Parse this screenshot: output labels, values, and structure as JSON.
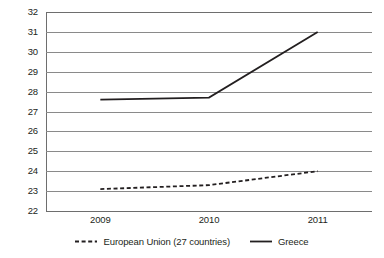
{
  "chart_data": {
    "type": "line",
    "title": "",
    "subtitle": "",
    "xlabel": "",
    "ylabel": "",
    "categories": [
      "2009",
      "2010",
      "2011"
    ],
    "ylim": [
      22,
      32
    ],
    "y_ticks": [
      22,
      23,
      24,
      25,
      26,
      27,
      28,
      29,
      30,
      31,
      32
    ],
    "y_tick_labels": [
      "22",
      "23",
      "24",
      "25",
      "26",
      "27",
      "28",
      "29",
      "30",
      "31",
      "32"
    ],
    "grid": true,
    "grid_axis": "y",
    "legend_position": "bottom",
    "series": [
      {
        "name": "European Union (27 countries)",
        "values": [
          23.1,
          23.3,
          24.0
        ],
        "style": "dashed",
        "color": "#231f20"
      },
      {
        "name": "Greece",
        "values": [
          27.6,
          27.7,
          31.0
        ],
        "style": "solid",
        "color": "#231f20"
      }
    ]
  },
  "legend": {
    "entries": [
      {
        "label": "European Union (27 countries)",
        "marker": "dashed-line-icon"
      },
      {
        "label": "Greece",
        "marker": "solid-line-icon"
      }
    ]
  },
  "colors": {
    "series_line": "#231f20",
    "gridline": "#8a8a8a",
    "axis": "#6e6e6e",
    "background": "#ffffff",
    "text": "#231f20"
  }
}
